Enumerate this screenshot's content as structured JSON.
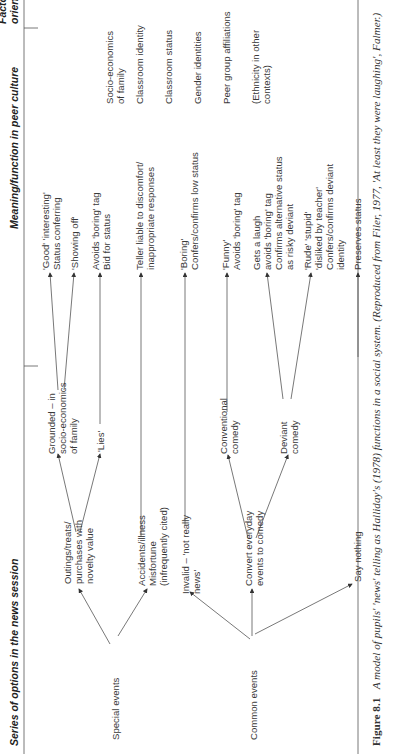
{
  "headers": {
    "col1": "Series of options in the news session",
    "col2": "Meaning/function in peer culture",
    "col3_line1": "Factors affecting",
    "col3_line2": "orientation and access"
  },
  "roots": {
    "special": "Special events",
    "common": "Common events"
  },
  "level1": {
    "outings": [
      "Outings/treats/",
      "purchases with",
      "novelty value"
    ],
    "accidents": [
      "Accidents/illness",
      "Misfortune",
      "(infrequently cited)"
    ],
    "invalid": [
      "Invalid – 'not really",
      "news'"
    ],
    "convert": [
      "Convert everyday",
      "events to comedy"
    ],
    "say_nothing": "Say nothing"
  },
  "level2": {
    "grounded": [
      "Grounded – in",
      "socio-economics",
      "of family"
    ],
    "lies": "'Lies'",
    "conventional": [
      "Conventional",
      "comedy"
    ],
    "deviant": [
      "Deviant",
      "comedy"
    ]
  },
  "meanings": {
    "good": [
      "'Good' 'interesting'",
      "Status conferring"
    ],
    "showing_off": "'Showing off'",
    "avoids_boring": [
      "Avoids 'boring' tag",
      "Bid for status"
    ],
    "teller_liable": [
      "Teller liable to discomfort/",
      "inappropriate responses"
    ],
    "boring": [
      "'Boring'",
      "Confers/confirms low status"
    ],
    "funny": [
      "'Funny'",
      "Avoids 'boring' tag"
    ],
    "gets_laugh": [
      "Gets a laugh",
      "avoids 'boring' tag",
      "Confirms alternative status",
      "as risky deviant"
    ],
    "rude": [
      "'Rude' 'stupid'",
      "'disliked by teacher'",
      "Confers/confirms deviant",
      "identity"
    ],
    "preserves": "Preserves status"
  },
  "factors": {
    "socio": [
      "Socio-economics",
      "of family"
    ],
    "classroom_identity": "Classroom identity",
    "classroom_status": "Classroom status",
    "gender": "Gender identities",
    "peer": "Peer group affiliations",
    "ethnicity": [
      "(Ethnicity in other",
      "contexts)"
    ]
  },
  "caption": {
    "label": "Figure 8.1",
    "text": "A model of pupils' 'news' telling as Halliday's (1978) functions in a social system. (Reproduced from Filer, 1977, 'At least they were laughing', Falmer.)"
  }
}
